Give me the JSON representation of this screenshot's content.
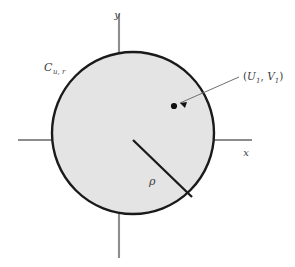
{
  "figure": {
    "background_color": "#ffffff",
    "disk_fill_color": "#e4e4e4",
    "disk_stroke_color": "#1a1a1a",
    "axis_color": "#8d8d8d",
    "label_color": "#3d3d3d"
  },
  "axes": {
    "x_label": "x",
    "y_label": "y",
    "origin": {
      "x": 133,
      "y": 140
    },
    "x_range_px": [
      18,
      252
    ],
    "y_range_px": [
      14,
      258
    ]
  },
  "disk": {
    "label_main": "C",
    "label_subscript": "u, r",
    "center": {
      "x": 133,
      "y": 133
    },
    "radius_px": 82
  },
  "radius_segment": {
    "label": "ρ",
    "from": {
      "x": 133,
      "y": 140
    },
    "to": {
      "x": 192,
      "y": 197
    }
  },
  "sample_point": {
    "label_open": "(",
    "label_u": "U",
    "label_u_sub": "1",
    "label_comma": ", ",
    "label_v": "V",
    "label_v_sub": "1",
    "label_close": ")",
    "dot": {
      "x": 174,
      "y": 106
    },
    "leader_from": {
      "x": 239,
      "y": 77
    },
    "leader_to": {
      "x": 180,
      "y": 103
    }
  }
}
